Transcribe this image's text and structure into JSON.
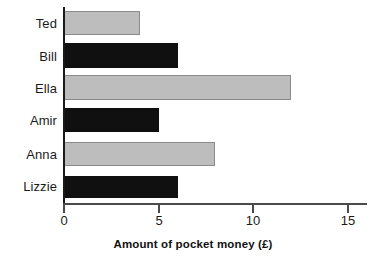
{
  "chart_data": {
    "type": "bar",
    "orientation": "horizontal",
    "title": "",
    "subtitle": "",
    "xlabel": "Amount of pocket money (£)",
    "ylabel": "",
    "categories": [
      "Ted",
      "Bill",
      "Ella",
      "Amir",
      "Anna",
      "Lizzie"
    ],
    "values": [
      4,
      6,
      12,
      5,
      8,
      6
    ],
    "bar_colors": [
      "#bdbdbd",
      "#101010",
      "#bdbdbd",
      "#101010",
      "#bdbdbd",
      "#101010"
    ],
    "bar_color_names": [
      "gray",
      "black",
      "gray",
      "black",
      "gray",
      "black"
    ],
    "xlim": [
      0,
      15
    ],
    "xticks": [
      0,
      5,
      10,
      15
    ],
    "xtick_labels": [
      "0",
      "5",
      "10",
      "15"
    ],
    "grid": false,
    "legend": null,
    "annotations": [],
    "series": [
      {
        "name": "Amount of pocket money (£)",
        "values": [
          4,
          6,
          12,
          5,
          8,
          6
        ]
      }
    ],
    "points": [
      {
        "category": "Ted",
        "value": 4,
        "color": "#bdbdbd"
      },
      {
        "category": "Bill",
        "value": 6,
        "color": "#101010"
      },
      {
        "category": "Ella",
        "value": 12,
        "color": "#bdbdbd"
      },
      {
        "category": "Amir",
        "value": 5,
        "color": "#101010"
      },
      {
        "category": "Anna",
        "value": 8,
        "color": "#bdbdbd"
      },
      {
        "category": "Lizzie",
        "value": 6,
        "color": "#101010"
      }
    ]
  },
  "axis": {
    "x_title": "Amount of pocket money (£)",
    "tick_0": "0",
    "tick_1": "5",
    "tick_2": "10",
    "tick_3": "15"
  },
  "colors": {
    "bar_gray": "#bdbdbd",
    "bar_gray_outline": "#8a8a8a",
    "bar_black": "#101010",
    "axis": "#1a1a1a",
    "background": "#ffffff"
  }
}
